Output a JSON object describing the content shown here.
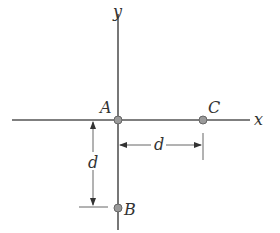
{
  "diagram": {
    "axes": {
      "x_label": "x",
      "y_label": "y"
    },
    "points": [
      {
        "name": "A",
        "x": 0,
        "y": 0
      },
      {
        "name": "C",
        "x": "d",
        "y": 0
      },
      {
        "name": "B",
        "x": 0,
        "y": "-d"
      }
    ],
    "dimensions": [
      {
        "label": "d",
        "from": "A",
        "to": "C",
        "orientation": "horizontal"
      },
      {
        "label": "d",
        "from": "A",
        "to": "B",
        "orientation": "vertical"
      }
    ],
    "colors": {
      "line": "#555555",
      "point": "#8a8a8a",
      "text": "#333333"
    }
  }
}
